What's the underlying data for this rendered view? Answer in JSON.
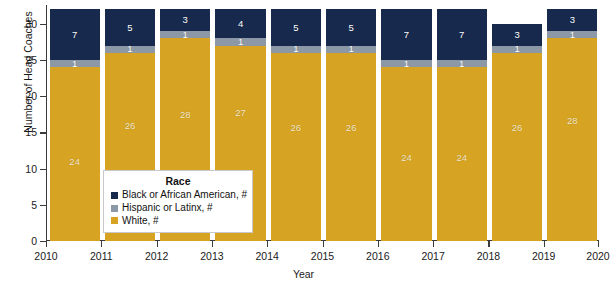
{
  "chart_data": {
    "type": "bar",
    "subtype": "stacked-bar",
    "title": "",
    "xlabel": "Year",
    "ylabel": "Number of Head Coaches",
    "categories": [
      "2010",
      "2011",
      "2012",
      "2013",
      "2014",
      "2015",
      "2016",
      "2017",
      "2018",
      "2019"
    ],
    "tick_labels_x": [
      "2010",
      "2011",
      "2012",
      "2013",
      "2014",
      "2015",
      "2016",
      "2017",
      "2018",
      "2019",
      "2020"
    ],
    "ylim": [
      0,
      32.6
    ],
    "yticks": [
      0,
      5,
      10,
      15,
      20,
      25,
      30
    ],
    "tick_labels_y": [
      "0",
      "5",
      "10",
      "15",
      "20",
      "25",
      "30"
    ],
    "grid": false,
    "legend": {
      "title": "Race",
      "position": "inside-lower-left",
      "entries": [
        {
          "label": "Black or African American, #",
          "color": "#17294d"
        },
        {
          "label": "Hispanic or Latinx, #",
          "color": "#8d98a7"
        },
        {
          "label": "White, #",
          "color": "#d6a323"
        }
      ]
    },
    "series": [
      {
        "name": "White, #",
        "key": "white",
        "color": "#d6a323",
        "values": [
          24,
          26,
          28,
          27,
          26,
          26,
          24,
          24,
          26,
          28
        ]
      },
      {
        "name": "Hispanic or Latinx, #",
        "key": "hispanic",
        "color": "#8d98a7",
        "values": [
          1,
          1,
          1,
          1,
          1,
          1,
          1,
          1,
          1,
          1
        ]
      },
      {
        "name": "Black or African American, #",
        "key": "black",
        "color": "#17294d",
        "values": [
          7,
          5,
          3,
          4,
          5,
          5,
          7,
          7,
          3,
          3
        ]
      }
    ],
    "totals": [
      32,
      32,
      32,
      32,
      32,
      32,
      32,
      32,
      30,
      32
    ]
  },
  "colors": {
    "white_seg": "#d6a323",
    "hispanic_seg": "#8d98a7",
    "black_seg": "#17294d",
    "axis": "#3b3b3b",
    "background": "#ffffff",
    "white_label": "#f6e9c8"
  }
}
